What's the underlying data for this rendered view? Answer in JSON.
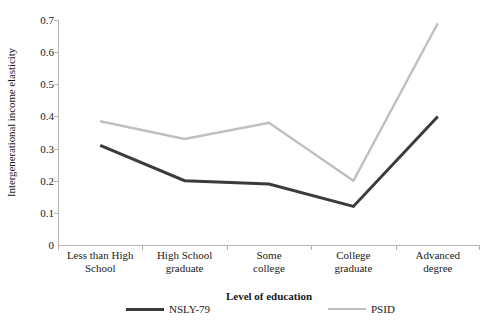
{
  "chart_data": {
    "type": "line",
    "title": "",
    "xlabel": "Level of education",
    "ylabel": "Intergenerational income elasticity",
    "categories": [
      "Less than High School",
      "High School graduate",
      "Some college",
      "College graduate",
      "Advanced degree"
    ],
    "category_lines": [
      [
        "Less than High",
        "School"
      ],
      [
        "High School",
        "graduate"
      ],
      [
        "Some",
        "college"
      ],
      [
        "College",
        "graduate"
      ],
      [
        "Advanced",
        "degree"
      ]
    ],
    "series": [
      {
        "name": "NSLY-79",
        "color": "#3b3b3b",
        "values": [
          0.31,
          0.2,
          0.19,
          0.12,
          0.4
        ]
      },
      {
        "name": "PSID",
        "color": "#bfbfbf",
        "values": [
          0.385,
          0.33,
          0.38,
          0.2,
          0.69
        ]
      }
    ],
    "ylim": [
      0,
      0.7
    ],
    "ytick_labels": [
      "0",
      "0.1",
      "0.2",
      "0.3",
      "0.4",
      "0.5",
      "0.6",
      "0.7"
    ],
    "ytick_values": [
      0,
      0.1,
      0.2,
      0.3,
      0.4,
      0.5,
      0.6,
      0.7
    ],
    "grid": false,
    "legend_position": "bottom"
  },
  "legend": {
    "entries": [
      {
        "label": "NSLY-79"
      },
      {
        "label": "PSID"
      }
    ]
  },
  "axes": {
    "y_title": "Intergenerational income elasticity",
    "x_title": "Level of education"
  }
}
